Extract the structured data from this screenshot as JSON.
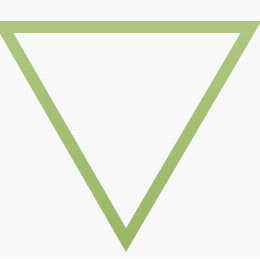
{
  "image": {
    "title": "Downward-Pointing Triangle Outline",
    "description": "A hollow equilateral-style triangle pointing downward, drawn as a thick light-green outline on a plain white background.",
    "width": 260,
    "height": 259,
    "background_color": "#ffffff",
    "rendering_style": "flat vector shape with subtle scanned paper texture"
  },
  "shape": {
    "name": "triangle-down",
    "type": "polygon",
    "fill": "none",
    "fill_color": "#ffffff",
    "stroke_color": "#a9c477",
    "stroke_width": 12,
    "orientation": "point-down",
    "vertices": [
      {
        "label": "top-left",
        "x": 3,
        "y": 27
      },
      {
        "label": "top-right",
        "x": 251,
        "y": 27
      },
      {
        "label": "bottom-apex",
        "x": 126,
        "y": 240
      }
    ],
    "points_attr": "3,27 251,27 126,240"
  },
  "palette": {
    "green": "#a9c477",
    "green_light": "#bcd391",
    "green_dark": "#97b363",
    "white": "#ffffff"
  }
}
